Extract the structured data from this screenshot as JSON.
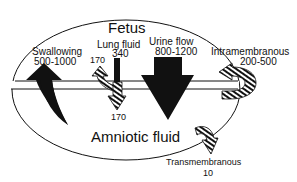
{
  "diagram": {
    "regions": {
      "fetus": "Fetus",
      "amniotic": "Amniotic fluid"
    },
    "flows": [
      {
        "name": "Swallowing",
        "value": "500-1000",
        "direction": "amniotic-to-fetus",
        "style": "solid"
      },
      {
        "name": "Lung fluid",
        "value": "340",
        "direction": "fetus-out",
        "style": "solid"
      },
      {
        "name": "Lung fluid reswallowed",
        "value": "170",
        "direction": "back-to-fetus",
        "style": "hatched"
      },
      {
        "name": "Lung fluid to amniotic",
        "value": "170",
        "direction": "fetus-to-amniotic",
        "style": "hatched"
      },
      {
        "name": "Urine flow",
        "value": "800-1200",
        "direction": "fetus-to-amniotic",
        "style": "solid"
      },
      {
        "name": "Intramembranous",
        "value": "200-500",
        "direction": "amniotic-to-fetus",
        "style": "hatched"
      },
      {
        "name": "Transmembranous",
        "value": "10",
        "direction": "amniotic-out",
        "style": "hatched"
      }
    ],
    "colors": {
      "ink": "#111111",
      "background": "#ffffff"
    }
  }
}
